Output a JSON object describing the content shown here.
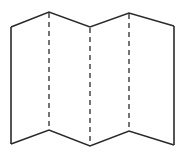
{
  "diagram": {
    "panel_count": 4,
    "fold_line_count": 3,
    "fold_line_style": "dashed",
    "outline_color": "#2a2a2a",
    "background_color": "#ffffff"
  }
}
